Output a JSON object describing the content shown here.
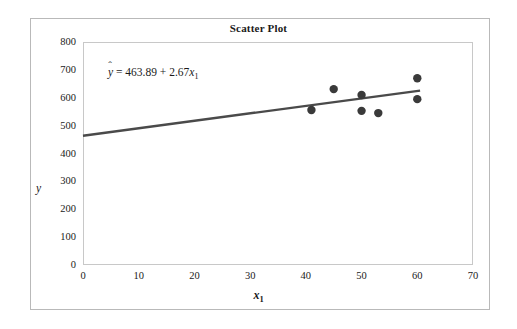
{
  "chart_data": {
    "type": "scatter",
    "title": "Scatter Plot",
    "xlabel": "x₁",
    "ylabel": "y",
    "xlim": [
      0,
      70
    ],
    "ylim": [
      0,
      800
    ],
    "xticks": [
      0,
      10,
      20,
      30,
      40,
      50,
      60,
      70
    ],
    "yticks": [
      0,
      100,
      200,
      300,
      400,
      500,
      600,
      700,
      800
    ],
    "grid": false,
    "legend": null,
    "points": [
      {
        "x": 41,
        "y": 556
      },
      {
        "x": 45,
        "y": 631
      },
      {
        "x": 50,
        "y": 610
      },
      {
        "x": 50,
        "y": 553
      },
      {
        "x": 53,
        "y": 545
      },
      {
        "x": 60,
        "y": 670
      },
      {
        "x": 60,
        "y": 595
      }
    ],
    "marker_color": "#3a3a3a",
    "trendline": {
      "intercept": 463.89,
      "slope": 2.67,
      "x_start": 0,
      "x_end": 60.5,
      "color": "#4a4a4a"
    },
    "annotations": [
      {
        "name": "regression-equation",
        "prefix": "y",
        "body": " = 463.89 + 2.67",
        "var": "x",
        "subscript": "1"
      }
    ]
  },
  "axis": {
    "y_tick_labels": [
      "800",
      "700",
      "600",
      "500",
      "400",
      "300",
      "200",
      "100",
      "0"
    ],
    "x_tick_labels": [
      "0",
      "10",
      "20",
      "30",
      "40",
      "50",
      "60",
      "70"
    ],
    "y_axis_title": "y",
    "x_axis_title_var": "x",
    "x_axis_title_sub": "1"
  },
  "colors": {
    "frame": "#b9b9b9",
    "plot_border": "#c8c8c8",
    "marker": "#3a3a3a",
    "line": "#4a4a4a",
    "text": "#1a1a1a",
    "background": "#ffffff"
  }
}
